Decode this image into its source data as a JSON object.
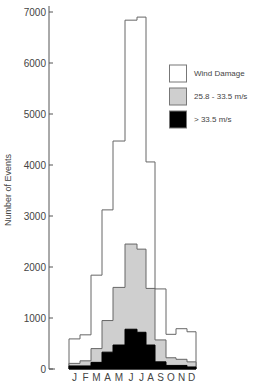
{
  "chart_data": {
    "type": "bar",
    "title": "",
    "xlabel": "",
    "ylabel": "Number of Events",
    "ylim": [
      0,
      7000
    ],
    "yticks": [
      0,
      1000,
      2000,
      3000,
      4000,
      5000,
      6000,
      7000
    ],
    "categories": [
      "J",
      "F",
      "M",
      "A",
      "M",
      "J",
      "J",
      "A",
      "S",
      "O",
      "N",
      "D"
    ],
    "grid": false,
    "legend_position": "upper right",
    "series": [
      {
        "name": "Wind Damage",
        "color": "#ffffff",
        "values": [
          590,
          670,
          1840,
          3120,
          4470,
          6840,
          6900,
          4060,
          1570,
          680,
          790,
          730
        ]
      },
      {
        "name": "25.8 - 33.5 m/s",
        "color": "#cfcfcf",
        "values": [
          110,
          160,
          400,
          950,
          1600,
          2450,
          2350,
          1580,
          570,
          220,
          190,
          140
        ]
      },
      {
        "name": "> 33.5 m/s",
        "color": "#000000",
        "values": [
          60,
          60,
          130,
          330,
          470,
          780,
          720,
          470,
          140,
          70,
          70,
          40
        ]
      }
    ]
  }
}
